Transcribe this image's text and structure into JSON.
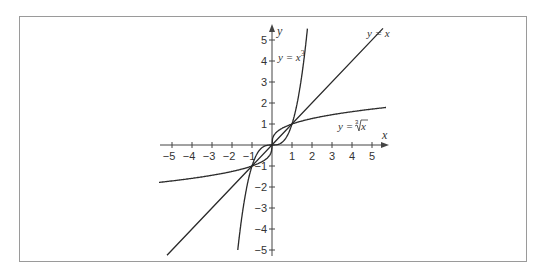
{
  "diagram": {
    "axes": {
      "x_label": "x",
      "y_label": "y",
      "x_ticks": [
        "−5",
        "−4",
        "−3",
        "−2",
        "−1",
        "1",
        "2",
        "3",
        "4",
        "5"
      ],
      "y_ticks": [
        "5",
        "4",
        "3",
        "2",
        "1",
        "−1",
        "−2",
        "−3",
        "−4",
        "−5"
      ]
    },
    "curves": [
      {
        "name": "cube",
        "label": "y = x",
        "superscript": "3"
      },
      {
        "name": "identity",
        "label": "y = x"
      },
      {
        "name": "cube-root",
        "label_prefix": "y = ",
        "radical_index": "3",
        "radicand": "x"
      }
    ],
    "colors": {
      "frame": "#9a9a9a",
      "curve": "#2a2a2a",
      "axis": "#444444"
    }
  }
}
